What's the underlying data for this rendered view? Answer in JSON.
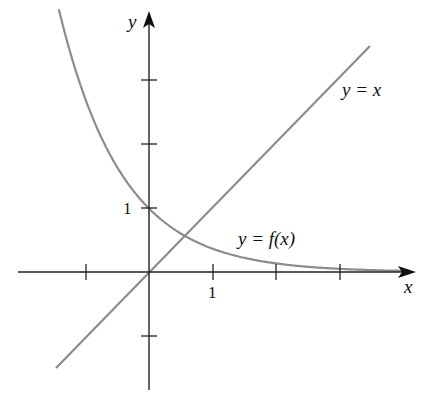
{
  "chart_data": {
    "type": "line",
    "title": "",
    "xlabel": "x",
    "ylabel": "y",
    "xlim": [
      -2.3,
      4.1
    ],
    "ylim": [
      -2.0,
      4.3
    ],
    "x_tick_positions": [
      -1,
      1,
      2,
      3
    ],
    "x_tick_labels": [
      "",
      "1",
      "",
      ""
    ],
    "y_tick_positions": [
      -1,
      1,
      2,
      3
    ],
    "y_tick_labels": [
      "",
      "1",
      "",
      ""
    ],
    "grid": false,
    "series": [
      {
        "name": "y = x",
        "label": "y = x",
        "function": "x",
        "x": [
          -1.45,
          3.3
        ],
        "y": [
          -1.45,
          3.3
        ],
        "color": "#8a8a8a"
      },
      {
        "name": "y = f(x)",
        "label": "y = f(x)",
        "function": "exp(-x)",
        "x": [
          -1.4,
          -1,
          0,
          0.57,
          1,
          2,
          3,
          4
        ],
        "y": [
          4.06,
          2.72,
          1.0,
          0.57,
          0.37,
          0.14,
          0.05,
          0.02
        ],
        "color": "#8a8a8a"
      }
    ],
    "annotations": [
      {
        "text": "y = x",
        "x": 3.1,
        "y": 2.9
      },
      {
        "text": "y = f(x)",
        "x": 1.9,
        "y": 0.6
      }
    ]
  },
  "labels": {
    "x_axis": "x",
    "y_axis": "y",
    "x_one": "1",
    "y_one": "1",
    "line_label": "y = x",
    "curve_label": "y = f(x)"
  }
}
